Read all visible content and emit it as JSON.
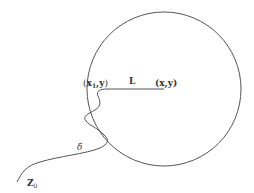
{
  "diagram": {
    "labels": {
      "start_point": {
        "open": "(",
        "x": "x",
        "sub": "1",
        "comma_y": ",y",
        "close": ")"
      },
      "segment": "L",
      "end_point": "(x,y)",
      "path": "δ",
      "origin": {
        "main": "Z",
        "sub": "0"
      }
    },
    "colors": {
      "stroke": "#555555",
      "text": "#333333",
      "background": "#ffffff"
    },
    "circle": {
      "cx": 164,
      "cy": 89,
      "r": 77
    }
  }
}
